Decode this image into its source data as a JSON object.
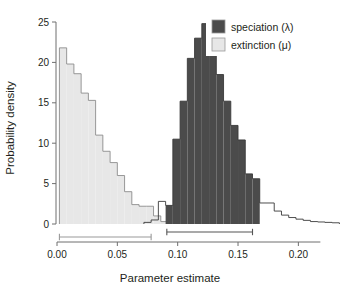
{
  "chart_data": {
    "type": "bar",
    "title": "",
    "xlabel": "Parameter estimate",
    "ylabel": "Probability density",
    "xlim": [
      0.0,
      0.2345
    ],
    "ylim": [
      0,
      25
    ],
    "xticks": [
      "0.00",
      "0.05",
      "0.10",
      "0.15",
      "0.20"
    ],
    "xtick_values": [
      0.0,
      0.05,
      0.1,
      0.15,
      0.2
    ],
    "yticks": [
      "0",
      "5",
      "10",
      "15",
      "20",
      "25"
    ],
    "ytick_values": [
      0,
      5,
      10,
      15,
      20,
      25
    ],
    "grid": false,
    "legend_position": "top-right",
    "bin_width": 0.006,
    "series": [
      {
        "name": "speciation (λ)",
        "legend_label": "speciation (λ)",
        "color": "#4b4b4b",
        "edge_color": "#3a3a3a",
        "bin_starts": [
          0.072,
          0.078,
          0.084,
          0.09,
          0.096,
          0.102,
          0.108,
          0.114,
          0.12,
          0.126,
          0.132,
          0.138,
          0.144,
          0.15,
          0.156,
          0.162,
          0.168,
          0.174,
          0.18,
          0.186,
          0.192,
          0.198,
          0.204,
          0.21,
          0.216,
          0.222,
          0.228
        ],
        "values": [
          0.2,
          0.5,
          2.8,
          2.3,
          10.5,
          15.2,
          20.5,
          23.0,
          24.8,
          21.5,
          18.5,
          15.2,
          12.2,
          10.4,
          6.2,
          5.6,
          2.6,
          2.6,
          1.6,
          1.1,
          0.8,
          0.6,
          0.45,
          0.3,
          0.25,
          0.2,
          0.15
        ],
        "filled_range": [
          0.09,
          0.168
        ],
        "credible_interval": [
          0.091,
          0.162
        ]
      },
      {
        "name": "extinction (μ)",
        "legend_label": "extinction (μ)",
        "color": "#e7e7e7",
        "edge_color": "#8c8c8c",
        "bin_starts": [
          0.002,
          0.008,
          0.014,
          0.02,
          0.026,
          0.032,
          0.038,
          0.044,
          0.05,
          0.056,
          0.062,
          0.068,
          0.074,
          0.08,
          0.086
        ],
        "values": [
          21.8,
          19.8,
          18.6,
          16.2,
          15.3,
          11.0,
          9.0,
          7.6,
          6.0,
          4.0,
          2.4,
          2.2,
          2.2,
          1.0,
          0.3
        ],
        "filled_range": [
          0.002,
          0.092
        ],
        "credible_interval": [
          0.002,
          0.078
        ]
      }
    ],
    "annotations": [
      {
        "name": "extinction-credible-interval",
        "x_start": 0.002,
        "x_end": 0.078,
        "color": "#9a9a9a"
      },
      {
        "name": "speciation-credible-interval",
        "x_start": 0.091,
        "x_end": 0.162,
        "color": "#555555"
      }
    ]
  },
  "legend": {
    "items": [
      {
        "label": "speciation (λ)",
        "swatch": "#4b4b4b"
      },
      {
        "label": "extinction (μ)",
        "swatch": "#e7e7e7"
      }
    ]
  },
  "axes": {
    "x_title": "Parameter estimate",
    "y_title": "Probability density"
  }
}
